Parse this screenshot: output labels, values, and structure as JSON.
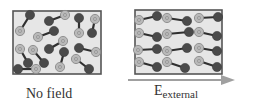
{
  "diagram": {
    "colors": {
      "box_fill": "#e6e6e6",
      "box_border": "#555555",
      "positive_atom": "#b9b9b9",
      "positive_ring": "#8a8a8a",
      "negative_atom": "#4a4a4a",
      "bond": "#303030",
      "arrow": "#a0a0a0",
      "text": "#333333"
    },
    "panels": [
      {
        "id": "no-field",
        "label": "No field",
        "box": {
          "x": 13,
          "y": 11,
          "w": 88,
          "h": 63
        },
        "state": "random orientation",
        "dipoles": [
          {
            "plus": [
              20,
              31
            ],
            "minus": [
              30,
              15
            ]
          },
          {
            "plus": [
              65,
              15
            ],
            "minus": [
              49,
              21
            ]
          },
          {
            "plus": [
              79,
              33
            ],
            "minus": [
              79,
              18
            ]
          },
          {
            "plus": [
              95,
              19
            ],
            "minus": [
              92,
              33
            ]
          },
          {
            "plus": [
              38,
              37
            ],
            "minus": [
              54,
              31
            ]
          },
          {
            "plus": [
              20,
              49
            ],
            "minus": [
              28,
              63
            ]
          },
          {
            "plus": [
              33,
              50
            ],
            "minus": [
              44,
              63
            ]
          },
          {
            "plus": [
              36,
              69
            ],
            "minus": [
              18,
              69
            ]
          },
          {
            "plus": [
              63,
              41
            ],
            "minus": [
              49,
              49
            ]
          },
          {
            "plus": [
              60,
              67
            ],
            "minus": [
              64,
              52
            ]
          },
          {
            "plus": [
              96,
              52
            ],
            "minus": [
              79,
              48
            ]
          },
          {
            "plus": [
              76,
              59
            ],
            "minus": [
              89,
              69
            ]
          }
        ]
      },
      {
        "id": "external-field",
        "label_main": "E",
        "label_sub": "external",
        "box": {
          "x": 135,
          "y": 10,
          "w": 87,
          "h": 64
        },
        "state": "aligned with field",
        "dipoles": [
          {
            "plus": [
              139,
              20
            ],
            "minus": [
              157,
              16
            ]
          },
          {
            "plus": [
              167,
              18
            ],
            "minus": [
              187,
              21
            ]
          },
          {
            "plus": [
              199,
              18
            ],
            "minus": [
              218,
              17
            ]
          },
          {
            "plus": [
              139,
              33
            ],
            "minus": [
              157,
              37
            ]
          },
          {
            "plus": [
              167,
              34
            ],
            "minus": [
              189,
              32
            ]
          },
          {
            "plus": [
              199,
              32
            ],
            "minus": [
              217,
              36
            ]
          },
          {
            "plus": [
              138,
              50
            ],
            "minus": [
              157,
              49
            ]
          },
          {
            "plus": [
              167,
              51
            ],
            "minus": [
              187,
              48
            ]
          },
          {
            "plus": [
              199,
              48
            ],
            "minus": [
              217,
              51
            ]
          },
          {
            "plus": [
              139,
              62
            ],
            "minus": [
              157,
              67
            ]
          },
          {
            "plus": [
              167,
              62
            ],
            "minus": [
              185,
              68
            ]
          },
          {
            "plus": [
              199,
              61
            ],
            "minus": [
              217,
              67
            ]
          }
        ]
      }
    ],
    "arrow": {
      "x1": 128,
      "y1": 80,
      "x2": 235,
      "y2": 80,
      "direction": "right"
    }
  }
}
